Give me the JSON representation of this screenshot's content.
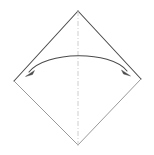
{
  "diagram": {
    "title": "Origami square base fold step",
    "type": "origami-fold-instruction",
    "canvas": {
      "width": 154,
      "height": 155,
      "background": "#ffffff"
    },
    "paper": {
      "name": "square-sheet-rotated-45",
      "shape": "square",
      "rotation_degrees": 45,
      "vertices": {
        "top": {
          "x": 78,
          "y": 11
        },
        "right": {
          "x": 141,
          "y": 79
        },
        "bottom": {
          "x": 78,
          "y": 145
        },
        "left": {
          "x": 14,
          "y": 81
        }
      },
      "edges": [
        {
          "name": "upper-left-edge",
          "from": "left",
          "to": "top",
          "color": "#4a4a4a",
          "width": 1.1
        },
        {
          "name": "upper-right-edge",
          "from": "top",
          "to": "right",
          "color": "#4a4a4a",
          "width": 1.1
        },
        {
          "name": "lower-right-edge",
          "from": "right",
          "to": "bottom",
          "color": "#9a9a9a",
          "width": 1.0
        },
        {
          "name": "lower-left-edge",
          "from": "bottom",
          "to": "left",
          "color": "#9a9a9a",
          "width": 1.0
        }
      ]
    },
    "crease_line": {
      "name": "vertical-center-crease",
      "style": "dash-dot",
      "orientation": "vertical",
      "from": {
        "x": 78,
        "y": 11
      },
      "to": {
        "x": 78,
        "y": 145
      },
      "color": "#c8c8c8",
      "width": 0.9,
      "dash_pattern": "5,2,1,2"
    },
    "fold_arrow": {
      "name": "double-headed-fold-arrow",
      "style": "curved-double-headed",
      "meaning": "fold-in-both-directions",
      "color": "#4a4a4a",
      "width": 1.1,
      "start": {
        "x": 27,
        "y": 74
      },
      "end": {
        "x": 129,
        "y": 73
      },
      "apex": {
        "x": 78,
        "y": 55
      },
      "control_points": [
        {
          "x": 44,
          "y": 51
        },
        {
          "x": 112,
          "y": 50
        }
      ],
      "arrowheads": [
        {
          "name": "left-arrowhead",
          "at": {
            "x": 27,
            "y": 74
          },
          "direction_degrees": 215,
          "filled": true
        },
        {
          "name": "right-arrowhead",
          "at": {
            "x": 129,
            "y": 73
          },
          "direction_degrees": 325,
          "filled": true
        }
      ]
    },
    "colors": {
      "background": "#ffffff",
      "edge_dark": "#4a4a4a",
      "edge_light": "#9a9a9a",
      "crease": "#c8c8c8",
      "arrow": "#4a4a4a"
    }
  }
}
